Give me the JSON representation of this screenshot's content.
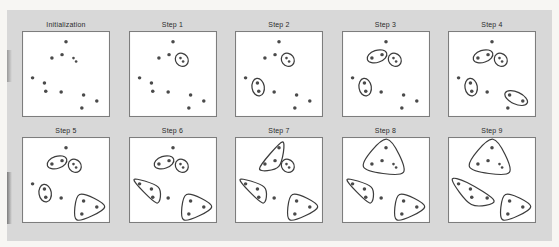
{
  "figure": {
    "colors": {
      "background": "#d8d8d8",
      "page": "#f7f6f3",
      "panel_bg": "#ffffff",
      "panel_border": "#7d7d7d",
      "dot": "#4a4a4a",
      "outline": "#3c3c3c",
      "title_text": "#2b2b2b"
    }
  },
  "chart_data": {
    "type": "scatter",
    "layout": {
      "rows": 2,
      "cols": 5,
      "grid": false,
      "legend": false
    },
    "coords": "percent of panel box, origin top-left, y down",
    "points": [
      [
        50,
        12.5
      ],
      [
        34,
        31.5
      ],
      [
        45.5,
        27.5
      ],
      [
        58.5,
        31.5
      ],
      [
        61.5,
        35.5
      ],
      [
        12,
        54.5
      ],
      [
        25.5,
        60.5
      ],
      [
        27,
        70
      ],
      [
        44.5,
        71
      ],
      [
        70,
        74.5
      ],
      [
        85,
        81.5
      ],
      [
        68,
        89.5
      ]
    ],
    "clusters": {
      "pair": {
        "members": [
          3,
          4
        ],
        "pad": 5.5
      },
      "mid-two": {
        "members": [
          1,
          2
        ],
        "pad": 5.5
      },
      "left-two": {
        "members": [
          6,
          7
        ],
        "pad": 5.5
      },
      "bottom-right-two": {
        "members": [
          9,
          10
        ],
        "pad": 5.5
      },
      "bottom-right-three": {
        "members": [
          9,
          10,
          11
        ],
        "pad": 9
      },
      "left-three": {
        "members": [
          5,
          6,
          7
        ],
        "pad": 8
      },
      "top-three": {
        "members": [
          0,
          1,
          2
        ],
        "pad": 8
      },
      "top-five": {
        "members": [
          0,
          1,
          2,
          3,
          4
        ],
        "pad": 10
      },
      "left-four": {
        "members": [
          5,
          6,
          7,
          8
        ],
        "pad": 8.5
      }
    },
    "panels": [
      {
        "label": "Initialization",
        "clusters": []
      },
      {
        "label": "Step 1",
        "clusters": [
          "pair"
        ]
      },
      {
        "label": "Step 2",
        "clusters": [
          "pair",
          "left-two"
        ]
      },
      {
        "label": "Step 3",
        "clusters": [
          "mid-two",
          "pair",
          "left-two"
        ]
      },
      {
        "label": "Step 4",
        "clusters": [
          "mid-two",
          "pair",
          "left-two",
          "bottom-right-two"
        ]
      },
      {
        "label": "Step 5",
        "clusters": [
          "mid-two",
          "pair",
          "left-two",
          "bottom-right-three"
        ]
      },
      {
        "label": "Step 6",
        "clusters": [
          "mid-two",
          "pair",
          "left-three",
          "bottom-right-three"
        ]
      },
      {
        "label": "Step 7",
        "clusters": [
          "top-three",
          "pair",
          "left-three",
          "bottom-right-three"
        ]
      },
      {
        "label": "Step 8",
        "clusters": [
          "top-five",
          "left-three",
          "bottom-right-three"
        ]
      },
      {
        "label": "Step 9",
        "clusters": [
          "top-five",
          "left-four",
          "bottom-right-three"
        ]
      }
    ]
  }
}
